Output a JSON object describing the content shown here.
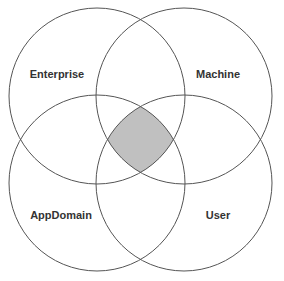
{
  "diagram": {
    "type": "venn",
    "sets": [
      {
        "id": "enterprise",
        "label": "Enterprise",
        "cx": 97,
        "cy": 96,
        "r": 88,
        "label_x": 57,
        "label_y": 78
      },
      {
        "id": "machine",
        "label": "Machine",
        "cx": 184,
        "cy": 96,
        "r": 88,
        "label_x": 218,
        "label_y": 78
      },
      {
        "id": "appdomain",
        "label": "AppDomain",
        "cx": 97,
        "cy": 183,
        "r": 88,
        "label_x": 61,
        "label_y": 219
      },
      {
        "id": "user",
        "label": "User",
        "cx": 184,
        "cy": 183,
        "r": 88,
        "label_x": 218,
        "label_y": 219
      }
    ],
    "highlight": {
      "description": "intersection of all four sets",
      "fill": "#c0c0c0"
    },
    "stroke_color": "#555555",
    "label_color": "#333333"
  }
}
